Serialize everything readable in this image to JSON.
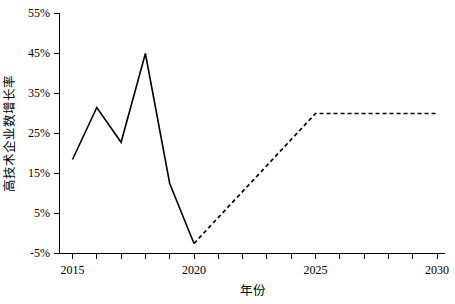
{
  "chart_data": {
    "type": "line",
    "title": "",
    "xlabel": "年份",
    "ylabel": "高技术企业数增长率",
    "xlim": [
      2014.3,
      2030.3
    ],
    "ylim": [
      -5,
      55
    ],
    "grid": false,
    "legend": "none",
    "x_ticks": [
      2015,
      2016,
      2017,
      2018,
      2019,
      2020,
      2021,
      2022,
      2023,
      2024,
      2025,
      2026,
      2027,
      2028,
      2029,
      2030
    ],
    "x_tick_labels": [
      "2015",
      "",
      "",
      "",
      "",
      "2020",
      "",
      "",
      "",
      "",
      "2025",
      "",
      "",
      "",
      "",
      "2030"
    ],
    "y_ticks": [
      -5,
      5,
      15,
      25,
      35,
      45,
      55
    ],
    "y_tick_labels": [
      "-5%",
      "5%",
      "15%",
      "25%",
      "35%",
      "45%",
      "55%"
    ],
    "series": [
      {
        "name": "历史值",
        "style": "solid",
        "x": [
          2015,
          2016,
          2017,
          2018,
          2019,
          2020
        ],
        "values": [
          18.5,
          31.5,
          22.8,
          45.0,
          12.5,
          -2.5
        ]
      },
      {
        "name": "预测值",
        "style": "dashed",
        "x": [
          2020,
          2025,
          2030
        ],
        "values": [
          -2.5,
          30.0,
          30.0
        ]
      }
    ],
    "line_color": "#000000"
  },
  "axis": {
    "y_label_text": "高技术企业数增长率",
    "x_label_text": "年份"
  }
}
